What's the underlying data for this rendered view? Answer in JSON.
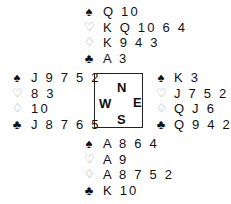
{
  "diagram": {
    "type": "bridge-deal",
    "suit_symbols": {
      "spades": "♠",
      "hearts": "♡",
      "diamonds": "♢",
      "clubs": "♣"
    },
    "compass": {
      "north": "N",
      "south": "S",
      "east": "E",
      "west": "W"
    },
    "hands": {
      "north": {
        "spades": "Q 10",
        "hearts": "K Q 10 6 4",
        "diamonds": "K 9 4 3",
        "clubs": "A 3"
      },
      "west": {
        "spades": "J 9 7 5 2",
        "hearts": "8 3",
        "diamonds": "10",
        "clubs": "J 8 7 6 5"
      },
      "east": {
        "spades": "K 3",
        "hearts": "J 7 5 2",
        "diamonds": "Q J 6",
        "clubs": "Q 9 4 2"
      },
      "south": {
        "spades": "A 8 6 4",
        "hearts": "A 9",
        "diamonds": "A 8 7 5 2",
        "clubs": "K 10"
      }
    }
  }
}
